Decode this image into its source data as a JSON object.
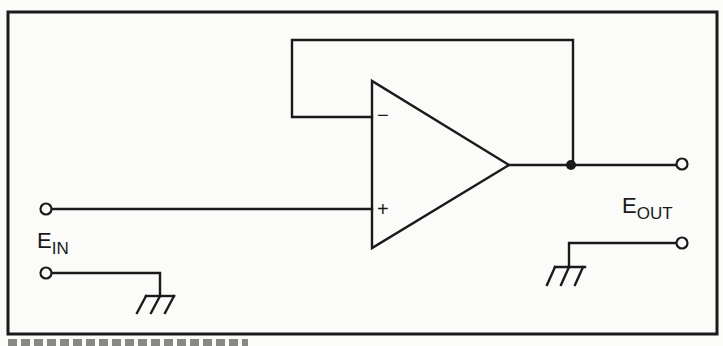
{
  "diagram": {
    "type": "op-amp voltage follower (unity-gain buffer) circuit",
    "components": {
      "op_amp": {
        "inverting_input_symbol": "−",
        "non_inverting_input_symbol": "+",
        "feedback": "output connected directly to inverting input"
      },
      "junction_dot": "output node"
    },
    "labels": {
      "input": {
        "main": "E",
        "sub": "IN"
      },
      "output": {
        "main": "E",
        "sub": "OUT"
      }
    },
    "terminals": [
      "input-signal-terminal",
      "input-ground-terminal",
      "output-signal-terminal",
      "output-ground-terminal"
    ],
    "grounds": [
      "input-ground",
      "output-ground"
    ],
    "colors": {
      "ink": "#1a1a1a",
      "paper": "#fbfbf9"
    }
  }
}
